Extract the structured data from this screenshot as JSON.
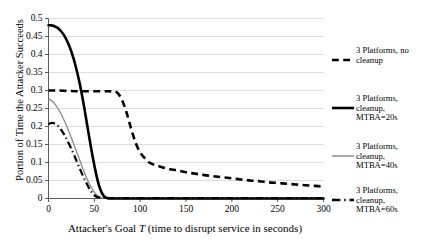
{
  "chart_data": {
    "type": "line",
    "title": "",
    "xlabel": "Attacker's Goal T (time to disrupt service in seconds)",
    "xlabel_prefix": "Attacker's Goal ",
    "xlabel_italic": "T",
    "xlabel_suffix": " (time to disrupt service in seconds)",
    "ylabel": "Portion of Time the Attacker Succeeds",
    "xlim": [
      0,
      300
    ],
    "ylim": [
      0,
      0.5
    ],
    "grid": "horizontal",
    "legend_position": "right",
    "xticks": [
      "0",
      "50",
      "100",
      "150",
      "200",
      "250",
      "300"
    ],
    "xtick_values": [
      0,
      50,
      100,
      150,
      200,
      250,
      300
    ],
    "yticks": [
      "0",
      "0.05",
      "0.1",
      "0.15",
      "0.2",
      "0.25",
      "0.3",
      "0.35",
      "0.4",
      "0.45",
      "0.5"
    ],
    "ytick_values": [
      0,
      0.05,
      0.1,
      0.15,
      0.2,
      0.25,
      0.3,
      0.35,
      0.4,
      0.45,
      0.5
    ],
    "series": [
      {
        "name": "3 Platforms, no cleanup",
        "style": "dashed",
        "color": "#000000",
        "width": 2.6,
        "x": [
          0,
          5,
          10,
          20,
          30,
          40,
          50,
          60,
          65,
          70,
          75,
          80,
          85,
          90,
          95,
          100,
          105,
          110,
          115,
          120,
          130,
          140,
          150,
          160,
          170,
          180,
          190,
          200,
          210,
          220,
          230,
          240,
          250,
          260,
          270,
          280,
          290,
          300
        ],
        "y": [
          0.3,
          0.3,
          0.3,
          0.299,
          0.298,
          0.298,
          0.298,
          0.298,
          0.298,
          0.297,
          0.294,
          0.275,
          0.24,
          0.195,
          0.155,
          0.128,
          0.112,
          0.1,
          0.094,
          0.09,
          0.083,
          0.078,
          0.073,
          0.069,
          0.065,
          0.062,
          0.059,
          0.056,
          0.053,
          0.05,
          0.048,
          0.045,
          0.043,
          0.041,
          0.039,
          0.037,
          0.035,
          0.033
        ]
      },
      {
        "name": "3 Platforms, cleanup, MTBA=20s",
        "style": "solid",
        "color": "#000000",
        "width": 2.6,
        "x": [
          0,
          3,
          6,
          10,
          14,
          18,
          22,
          26,
          30,
          34,
          38,
          42,
          46,
          50,
          54,
          57,
          60,
          63,
          70,
          100,
          150,
          200,
          250,
          300
        ],
        "y": [
          0.481,
          0.481,
          0.479,
          0.474,
          0.464,
          0.449,
          0.428,
          0.4,
          0.364,
          0.32,
          0.267,
          0.207,
          0.147,
          0.092,
          0.046,
          0.022,
          0.008,
          0.002,
          0,
          0,
          0,
          0,
          0,
          0
        ]
      },
      {
        "name": "3 Platforms, cleanup, MTBA=40s",
        "style": "solid",
        "color": "#8b8b8b",
        "width": 1.3,
        "x": [
          0,
          2,
          5,
          8,
          12,
          16,
          20,
          24,
          28,
          32,
          36,
          40,
          44,
          48,
          51,
          54,
          57,
          60,
          80,
          120,
          180,
          240,
          300
        ],
        "y": [
          0.276,
          0.274,
          0.268,
          0.259,
          0.243,
          0.223,
          0.2,
          0.175,
          0.148,
          0.12,
          0.093,
          0.067,
          0.044,
          0.025,
          0.014,
          0.007,
          0.003,
          0.001,
          0,
          0,
          0,
          0,
          0
        ]
      },
      {
        "name": "3 Platforms, cleanup, MTBA=60s",
        "style": "dashdot",
        "color": "#000000",
        "width": 2.2,
        "x": [
          0,
          2,
          4,
          6,
          8,
          11,
          14,
          17,
          20,
          24,
          28,
          32,
          36,
          40,
          44,
          47,
          50,
          55,
          70,
          110,
          160,
          210,
          260,
          300
        ],
        "y": [
          0.206,
          0.209,
          0.21,
          0.209,
          0.206,
          0.2,
          0.19,
          0.178,
          0.164,
          0.143,
          0.12,
          0.096,
          0.072,
          0.05,
          0.03,
          0.018,
          0.009,
          0.003,
          0.001,
          0.001,
          0.001,
          0.001,
          0.001,
          0.001
        ]
      }
    ]
  },
  "legend": {
    "items": [
      {
        "label": "3 Platforms, no\ncleanup",
        "style": "dashed",
        "color": "#000000"
      },
      {
        "label": "3 Platforms,\ncleanup,\nMTBA=20s",
        "style": "solid",
        "color": "#000000"
      },
      {
        "label": "3 Platforms,\ncleanup,\nMTBA=40s",
        "style": "solid",
        "color": "#8b8b8b"
      },
      {
        "label": "3 Platforms,\ncleanup,\nMTBA=60s",
        "style": "dashdot",
        "color": "#000000"
      }
    ]
  },
  "axes": {
    "x_title_prefix": "Attacker's Goal ",
    "x_title_italic": "T",
    "x_title_suffix": " (time to disrupt service in seconds)",
    "y_title": "Portion of Time the Attacker Succeeds"
  }
}
